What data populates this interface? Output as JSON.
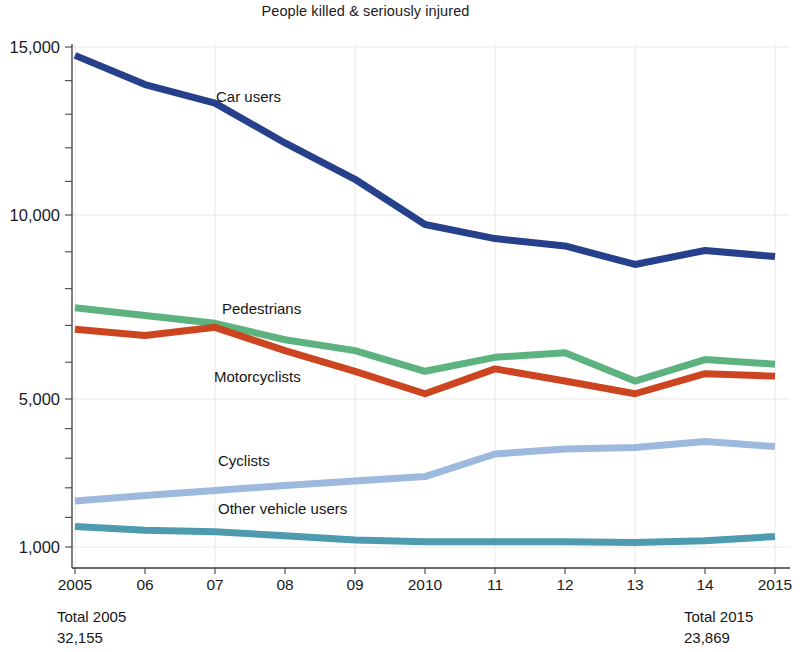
{
  "chart_data": {
    "type": "line",
    "title": "People killed & seriously injured",
    "xlabel": "",
    "ylabel": "",
    "x": [
      2005,
      2006,
      2007,
      2008,
      2009,
      2010,
      2011,
      2012,
      2013,
      2014,
      2015
    ],
    "categories": [
      "2005",
      "06",
      "07",
      "08",
      "09",
      "2010",
      "11",
      "12",
      "13",
      "14",
      "2015"
    ],
    "ytick_labels": [
      "15,000",
      "10,000",
      "5,000",
      "1,000"
    ],
    "ytick_values": [
      15000,
      10000,
      5000,
      1000
    ],
    "ylim": [
      800,
      16000
    ],
    "grid": true,
    "legend_position": "inline-labels",
    "series": [
      {
        "name": "Car users",
        "color": "#27408b",
        "values": [
          14700,
          13700,
          13100,
          11900,
          10900,
          9650,
          9150,
          8900,
          8300,
          8750,
          8550
        ]
      },
      {
        "name": "Pedestrians",
        "color": "#5cb37f",
        "values": [
          7050,
          6850,
          6650,
          6250,
          6000,
          5550,
          5850,
          5950,
          5350,
          5800,
          5700
        ]
      },
      {
        "name": "Motorcyclists",
        "color": "#cd4520",
        "values": [
          6500,
          6350,
          6550,
          6000,
          5550,
          5100,
          5600,
          5350,
          5100,
          5500,
          5450
        ]
      },
      {
        "name": "Cyclists",
        "color": "#9db9de",
        "values": [
          1650,
          1750,
          1850,
          1950,
          2050,
          2150,
          2750,
          2900,
          2950,
          3150,
          2980
        ]
      },
      {
        "name": "Other vehicle users",
        "color": "#4e9bb0",
        "values": [
          1250,
          1200,
          1180,
          1130,
          1080,
          1060,
          1060,
          1060,
          1050,
          1070,
          1120
        ]
      }
    ],
    "annotations": [
      {
        "name": "total-2005",
        "line1": "Total 2005",
        "line2": "32,155"
      },
      {
        "name": "total-2015",
        "line1": "Total 2015",
        "line2": "23,869"
      }
    ]
  }
}
